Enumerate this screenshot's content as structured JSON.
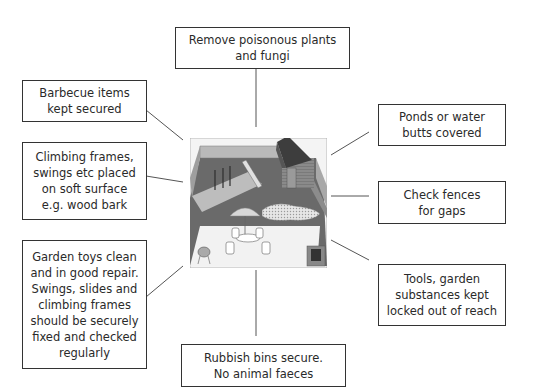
{
  "labels": {
    "top": "Remove poisonous plants\nand fungi",
    "barbecue": "Barbecue items\nkept secured",
    "climbing": "Climbing frames,\nswings etc placed\non soft surface\ne.g. wood bark",
    "toys": "Garden toys clean\nand in good repair.\nSwings, slides and\nclimbing frames\nshould be securely\nfixed and checked\nregularly",
    "ponds": "Ponds or water\nbutts covered",
    "fences": "Check fences\nfor gaps",
    "tools": "Tools, garden\nsubstances kept\nlocked out of reach",
    "bins": "Rubbish bins secure.\nNo animal faeces"
  },
  "illustration": {
    "subject": "garden-scene",
    "elements": [
      "shed",
      "fence",
      "swing-set",
      "slide",
      "wood-bark-area",
      "pond",
      "parasol",
      "patio-table",
      "chairs",
      "barbecue",
      "bin-store",
      "patio"
    ]
  }
}
